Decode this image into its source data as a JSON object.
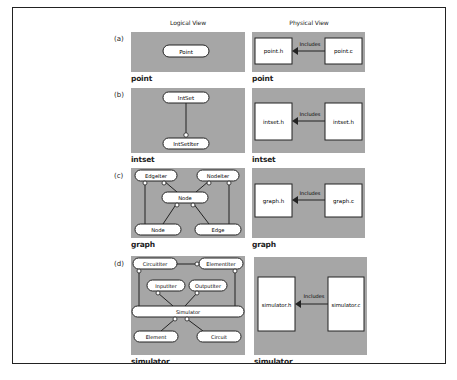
{
  "columns": {
    "logical": "Logical View",
    "physical": "Physical View"
  },
  "rows": [
    {
      "tag": "(a)",
      "logical": {
        "caption": "point",
        "nodes": [
          "Point"
        ]
      },
      "physical": {
        "caption": "point",
        "header": "point.h",
        "source": "point.c",
        "edge_label": "Includes"
      }
    },
    {
      "tag": "(b)",
      "logical": {
        "caption": "intset",
        "nodes": [
          "IntSet",
          "IntSetIter"
        ]
      },
      "physical": {
        "caption": "intset",
        "header": "intset.h",
        "source": "intset.h",
        "edge_label": "Includes"
      }
    },
    {
      "tag": "(c)",
      "logical": {
        "caption": "graph",
        "nodes": [
          "EdgeIter",
          "NodeIter",
          "Node",
          "Node",
          "Edge"
        ]
      },
      "physical": {
        "caption": "graph",
        "header": "graph.h",
        "source": "graph.c",
        "edge_label": "Includes"
      }
    },
    {
      "tag": "(d)",
      "logical": {
        "caption": "simulator",
        "nodes": [
          "CircuitIter",
          "ElementIter",
          "InputIter",
          "OutputIter",
          "Simulator",
          "Element",
          "Circuit"
        ]
      },
      "physical": {
        "caption": "simulator",
        "header": "simulator.h",
        "source": "simulator.c",
        "edge_label": "Includes"
      }
    }
  ],
  "colors": {
    "panel_bg": "#a6a6a6",
    "node_fill": "#ffffff",
    "stroke": "#222222"
  }
}
